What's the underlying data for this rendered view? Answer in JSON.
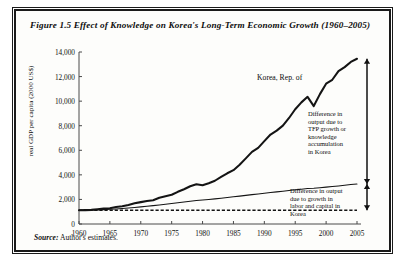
{
  "figure": {
    "title": "Figure 1.5  Effect of Knowledge on Korea's Long-Term Economic Growth (1960–2005)",
    "source_label": "Source:",
    "source_text": "Author's estimates."
  },
  "annotations": {
    "series_label": "Korea, Rep. of",
    "tfp_gap": "Difference in\noutput due to\nTFP growth or\nknowledge\naccumulation\nin Korea",
    "tfp_gap_lines": [
      "Difference in",
      "output due to",
      "TFP growth or",
      "knowledge",
      "accumulation",
      "in Korea"
    ],
    "factor_gap_lines": [
      "Difference in output",
      "due to growth in",
      "labor and capital in",
      "Korea"
    ]
  },
  "colors": {
    "ink": "#141414",
    "frame": "#1a1a1a",
    "background": "#fdfdfb",
    "axis": "#4a4a4a"
  },
  "chart_data": {
    "type": "line",
    "title": "Effect of Knowledge on Korea's Long-Term Economic Growth (1960–2005)",
    "xlabel": "",
    "ylabel": "real GDP per capita (2000 US$)",
    "xlim": [
      1960,
      2005
    ],
    "ylim": [
      0,
      14000
    ],
    "yticks": [
      0,
      2000,
      4000,
      6000,
      8000,
      10000,
      12000,
      14000
    ],
    "ytick_labels": [
      "0",
      "2,000",
      "4,000",
      "6,000",
      "8,000",
      "10,000",
      "12,000",
      "14,000"
    ],
    "xticks": [
      1960,
      1965,
      1970,
      1975,
      1980,
      1985,
      1990,
      1995,
      2000,
      2005
    ],
    "xtick_labels": [
      "1960",
      "1965",
      "1970",
      "1975",
      "1980",
      "1985",
      "1990",
      "1995",
      "2000",
      "2005"
    ],
    "grid": false,
    "legend_position": "inline-annotations",
    "x": [
      1960,
      1961,
      1962,
      1963,
      1964,
      1965,
      1966,
      1967,
      1968,
      1969,
      1970,
      1971,
      1972,
      1973,
      1974,
      1975,
      1976,
      1977,
      1978,
      1979,
      1980,
      1981,
      1982,
      1983,
      1984,
      1985,
      1986,
      1987,
      1988,
      1989,
      1990,
      1991,
      1992,
      1993,
      1994,
      1995,
      1996,
      1997,
      1998,
      1999,
      2000,
      2001,
      2002,
      2003,
      2004,
      2005
    ],
    "series": [
      {
        "name": "Korea, Rep. of",
        "role": "actual real GDP per capita",
        "style": "thick solid line",
        "values": [
          1120,
          1130,
          1150,
          1200,
          1250,
          1290,
          1380,
          1440,
          1550,
          1680,
          1780,
          1870,
          1940,
          2130,
          2260,
          2380,
          2620,
          2830,
          3070,
          3230,
          3150,
          3320,
          3520,
          3830,
          4130,
          4380,
          4820,
          5340,
          5870,
          6200,
          6750,
          7280,
          7600,
          8010,
          8630,
          9340,
          9900,
          10350,
          9600,
          10570,
          11420,
          11740,
          12440,
          12770,
          13190,
          13450
        ]
      },
      {
        "name": "Output from labor and capital accumulation",
        "role": "counterfactual with factor growth only",
        "style": "thin solid line",
        "values": [
          1120,
          1125,
          1135,
          1150,
          1170,
          1195,
          1225,
          1260,
          1300,
          1345,
          1395,
          1445,
          1495,
          1550,
          1610,
          1665,
          1725,
          1785,
          1845,
          1905,
          1950,
          1995,
          2045,
          2100,
          2155,
          2210,
          2270,
          2330,
          2390,
          2445,
          2505,
          2560,
          2615,
          2670,
          2725,
          2780,
          2835,
          2885,
          2905,
          2950,
          3000,
          3045,
          3095,
          3150,
          3210,
          3260
        ]
      },
      {
        "name": "Baseline 1960 output level",
        "role": "constant reference level",
        "style": "dotted line",
        "values": [
          1120,
          1120,
          1120,
          1120,
          1120,
          1120,
          1120,
          1120,
          1120,
          1120,
          1120,
          1120,
          1120,
          1120,
          1120,
          1120,
          1120,
          1120,
          1120,
          1120,
          1120,
          1120,
          1120,
          1120,
          1120,
          1120,
          1120,
          1120,
          1120,
          1120,
          1120,
          1120,
          1120,
          1120,
          1120,
          1120,
          1120,
          1120,
          1120,
          1120,
          1120,
          1120,
          1120,
          1120,
          1120,
          1120
        ]
      }
    ],
    "gap_annotations": [
      {
        "label": "Difference in output due to TFP growth or knowledge accumulation in Korea",
        "at_year": 2005,
        "from": 3260,
        "to": 13450
      },
      {
        "label": "Difference in output due to growth in labor and capital in Korea",
        "at_year": 2005,
        "from": 1120,
        "to": 3260
      }
    ]
  }
}
